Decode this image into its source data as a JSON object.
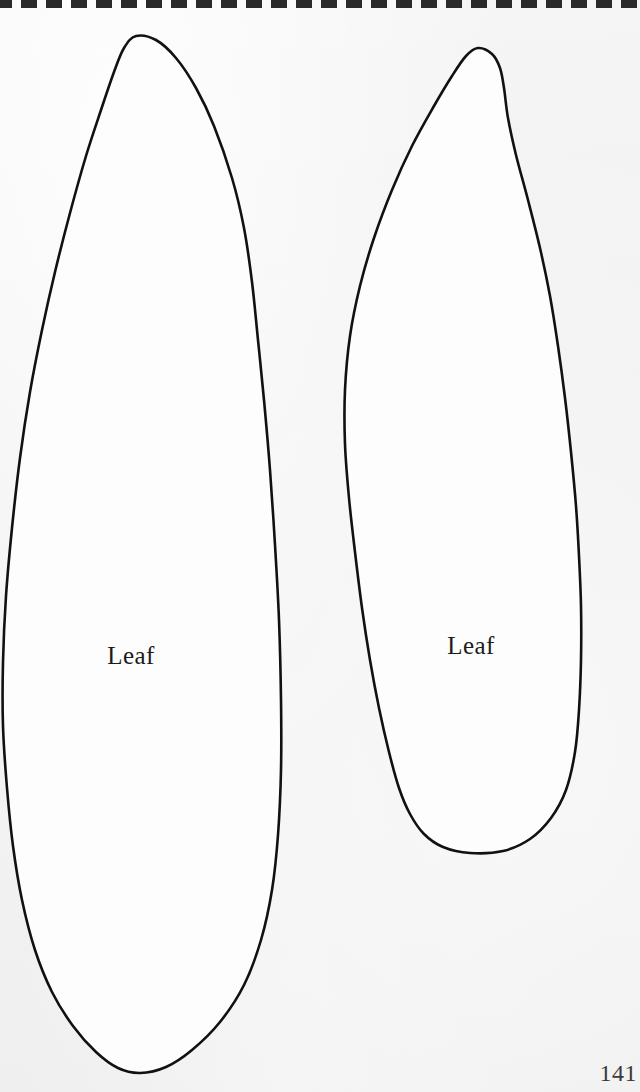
{
  "page": {
    "kind": "craft-pattern-template-page",
    "background_color": "#f2f2f2",
    "ink_color": "#111111",
    "page_number": "141",
    "top_edge": {
      "style": "perforated-dashed-tear-strip",
      "dash_color": "#2a2a2a",
      "dash_width_px": 16,
      "dash_gap_px": 9,
      "dash_height_px": 8,
      "dash_count": 26
    }
  },
  "templates": [
    {
      "id": "leaf-left",
      "label": "Leaf",
      "label_center": {
        "x": 131,
        "y": 656
      },
      "tip": {
        "x": 136,
        "y": 36
      },
      "base": {
        "x": 140,
        "y": 1073
      },
      "widest_span": {
        "left_x": 3,
        "right_x": 281,
        "y": 712
      },
      "outline_points": [
        [
          136,
          36
        ],
        [
          156,
          40
        ],
        [
          176,
          58
        ],
        [
          196,
          88
        ],
        [
          214,
          126
        ],
        [
          232,
          178
        ],
        [
          244,
          228
        ],
        [
          252,
          282
        ],
        [
          258,
          340
        ],
        [
          264,
          400
        ],
        [
          270,
          470
        ],
        [
          275,
          545
        ],
        [
          279,
          620
        ],
        [
          281,
          700
        ],
        [
          281,
          770
        ],
        [
          278,
          835
        ],
        [
          272,
          890
        ],
        [
          261,
          940
        ],
        [
          244,
          985
        ],
        [
          220,
          1022
        ],
        [
          192,
          1050
        ],
        [
          166,
          1067
        ],
        [
          140,
          1073
        ],
        [
          118,
          1068
        ],
        [
          96,
          1052
        ],
        [
          73,
          1026
        ],
        [
          52,
          992
        ],
        [
          35,
          950
        ],
        [
          22,
          900
        ],
        [
          13,
          846
        ],
        [
          7,
          788
        ],
        [
          3,
          726
        ],
        [
          3,
          662
        ],
        [
          6,
          596
        ],
        [
          12,
          528
        ],
        [
          20,
          458
        ],
        [
          30,
          392
        ],
        [
          42,
          330
        ],
        [
          55,
          272
        ],
        [
          70,
          213
        ],
        [
          86,
          156
        ],
        [
          101,
          110
        ],
        [
          114,
          72
        ],
        [
          124,
          48
        ]
      ]
    },
    {
      "id": "leaf-right",
      "label": "Leaf",
      "label_center": {
        "x": 471,
        "y": 646
      },
      "tip": {
        "x": 478,
        "y": 48
      },
      "base": {
        "x": 470,
        "y": 853
      },
      "widest_span": {
        "left_x": 345,
        "right_x": 581,
        "y": 600
      },
      "outline_points": [
        [
          478,
          48
        ],
        [
          492,
          54
        ],
        [
          500,
          68
        ],
        [
          504,
          88
        ],
        [
          508,
          118
        ],
        [
          516,
          155
        ],
        [
          528,
          200
        ],
        [
          540,
          248
        ],
        [
          550,
          296
        ],
        [
          558,
          346
        ],
        [
          565,
          398
        ],
        [
          571,
          452
        ],
        [
          576,
          506
        ],
        [
          579,
          556
        ],
        [
          581,
          606
        ],
        [
          581,
          660
        ],
        [
          579,
          710
        ],
        [
          575,
          752
        ],
        [
          566,
          790
        ],
        [
          551,
          818
        ],
        [
          530,
          839
        ],
        [
          503,
          851
        ],
        [
          470,
          853
        ],
        [
          443,
          847
        ],
        [
          424,
          834
        ],
        [
          410,
          814
        ],
        [
          399,
          788
        ],
        [
          389,
          752
        ],
        [
          379,
          708
        ],
        [
          370,
          660
        ],
        [
          362,
          608
        ],
        [
          355,
          552
        ],
        [
          349,
          498
        ],
        [
          345,
          444
        ],
        [
          345,
          390
        ],
        [
          350,
          336
        ],
        [
          360,
          286
        ],
        [
          374,
          238
        ],
        [
          392,
          190
        ],
        [
          412,
          146
        ],
        [
          434,
          106
        ],
        [
          452,
          76
        ],
        [
          466,
          56
        ]
      ]
    }
  ]
}
